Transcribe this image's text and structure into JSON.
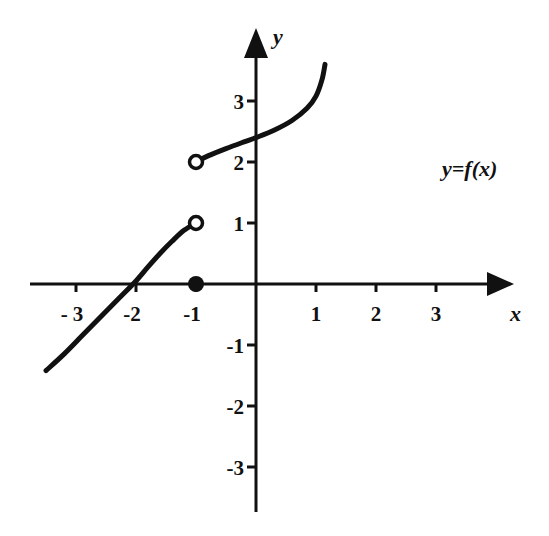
{
  "chart_data": {
    "type": "line",
    "title": "",
    "xlabel": "x",
    "ylabel": "y",
    "xlim": [
      -3.6,
      4.2
    ],
    "ylim": [
      -3.8,
      4.2
    ],
    "grid": false,
    "x_ticks": [
      -3,
      -2,
      -1,
      1,
      2,
      3
    ],
    "x_tick_labels": [
      "- 3",
      "-2",
      "-1",
      "1",
      "2",
      "3"
    ],
    "y_ticks": [
      3,
      2,
      1,
      -1,
      -2,
      -3
    ],
    "y_tick_labels": [
      "3",
      "2",
      "1",
      "-1",
      "-2",
      "-3"
    ],
    "function_label": "y=f(x)",
    "series": [
      {
        "name": "left-branch",
        "points": [
          [
            -3.5,
            -1.42
          ],
          [
            -3.2,
            -1.15
          ],
          [
            -2.9,
            -0.85
          ],
          [
            -2.6,
            -0.55
          ],
          [
            -2.3,
            -0.25
          ],
          [
            -2.0,
            0.05
          ],
          [
            -1.8,
            0.28
          ],
          [
            -1.6,
            0.5
          ],
          [
            -1.4,
            0.7
          ],
          [
            -1.2,
            0.88
          ],
          [
            -1.0,
            1.0
          ]
        ]
      },
      {
        "name": "right-branch",
        "points": [
          [
            -1.0,
            2.0
          ],
          [
            -0.8,
            2.1
          ],
          [
            -0.5,
            2.22
          ],
          [
            -0.2,
            2.33
          ],
          [
            0.0,
            2.4
          ],
          [
            0.3,
            2.52
          ],
          [
            0.6,
            2.68
          ],
          [
            0.85,
            2.88
          ],
          [
            1.0,
            3.08
          ],
          [
            1.1,
            3.35
          ],
          [
            1.15,
            3.6
          ]
        ]
      }
    ],
    "markers": [
      {
        "name": "open-circle-left-end",
        "x": -1,
        "y": 1,
        "filled": false
      },
      {
        "name": "open-circle-right-start",
        "x": -1,
        "y": 2,
        "filled": false
      },
      {
        "name": "filled-dot",
        "x": -1,
        "y": 0,
        "filled": true
      }
    ],
    "annotation": {
      "text": "y=f(x)",
      "x": 3.1,
      "y": 2.0
    }
  }
}
